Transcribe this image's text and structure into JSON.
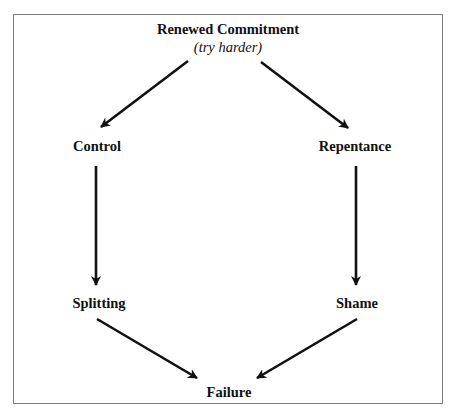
{
  "diagram": {
    "type": "cycle",
    "nodes": {
      "top": {
        "label": "Renewed Commitment",
        "sublabel": "(try harder)"
      },
      "left_upper": {
        "label": "Control"
      },
      "right_upper": {
        "label": "Repentance"
      },
      "left_lower": {
        "label": "Splitting"
      },
      "right_lower": {
        "label": "Shame"
      },
      "bottom": {
        "label": "Failure"
      }
    },
    "edges": [
      {
        "from": "Renewed Commitment",
        "to": "Control"
      },
      {
        "from": "Renewed Commitment",
        "to": "Repentance"
      },
      {
        "from": "Control",
        "to": "Splitting"
      },
      {
        "from": "Repentance",
        "to": "Shame"
      },
      {
        "from": "Splitting",
        "to": "Failure"
      },
      {
        "from": "Shame",
        "to": "Failure"
      }
    ],
    "colors": {
      "line": "#111111",
      "frame": "#7a7a7a",
      "background": "#ffffff"
    }
  }
}
